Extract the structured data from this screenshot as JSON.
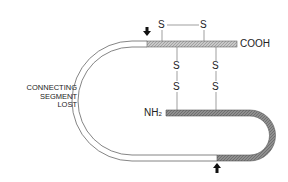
{
  "diagram": {
    "labels": {
      "cooh": "COOH",
      "nh2_main": "NH",
      "nh2_sub": "2",
      "connecting_segment_line1": "CONNECTING",
      "connecting_segment_line2": "SEGMENT",
      "connecting_segment_line3": "LOST",
      "s": "S"
    },
    "disulfide_bonds": [
      {
        "type": "intrachain",
        "chain": "A",
        "from": "S",
        "to": "S"
      },
      {
        "type": "interchain",
        "from": "S",
        "to": "S"
      },
      {
        "type": "interchain",
        "from": "S",
        "to": "S"
      }
    ],
    "cleavage_sites": [
      "top-arrow",
      "bottom-arrow"
    ],
    "colors": {
      "a_chain_fill": "#b8b8b8",
      "b_chain_fill": "#8a8a8a",
      "line": "#555555",
      "text": "#222222"
    }
  }
}
